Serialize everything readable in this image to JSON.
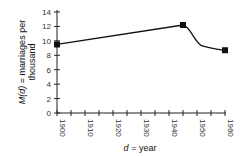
{
  "chart_data": {
    "type": "line",
    "title": "",
    "xlabel_var": "d",
    "xlabel_rest": " = year",
    "ylabel_var": "M(d)",
    "ylabel_line1_rest": " = marriages per",
    "ylabel_line2": "thousand",
    "x": [
      1900,
      1945,
      1960
    ],
    "y": [
      9.5,
      12.2,
      8.7
    ],
    "xlim": [
      1900,
      1960
    ],
    "ylim": [
      0,
      14
    ],
    "x_ticks": [
      1900,
      1905,
      1910,
      1915,
      1920,
      1925,
      1930,
      1935,
      1940,
      1945,
      1950,
      1955,
      1960
    ],
    "x_tick_labels": [
      "1900",
      "1910",
      "1920",
      "1930",
      "1940",
      "1950",
      "1960"
    ],
    "y_ticks": [
      0,
      2,
      4,
      6,
      8,
      10,
      12,
      14
    ],
    "y_tick_labels": [
      "0",
      "2",
      "4",
      "6",
      "8",
      "10",
      "12",
      "14"
    ],
    "grid": false,
    "legend": null,
    "markers": "square",
    "line_color": "#111111"
  }
}
